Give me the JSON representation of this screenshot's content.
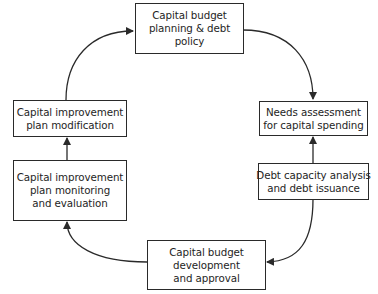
{
  "diagram": {
    "type": "cycle-flowchart",
    "nodes": [
      {
        "id": "planning",
        "lines": [
          "Capital budget",
          "planning & debt",
          "policy"
        ]
      },
      {
        "id": "needs",
        "lines": [
          "Needs assessment",
          "for capital spending"
        ]
      },
      {
        "id": "debt",
        "lines": [
          "Debt capacity analysis",
          "and debt issuance"
        ]
      },
      {
        "id": "development",
        "lines": [
          "Capital budget",
          "development",
          "and approval"
        ]
      },
      {
        "id": "monitoring",
        "lines": [
          "Capital improvement",
          "plan monitoring",
          "and evaluation"
        ]
      },
      {
        "id": "modification",
        "lines": [
          "Capital improvement",
          "plan modification"
        ]
      }
    ],
    "edges": [
      {
        "from": "planning",
        "to": "needs"
      },
      {
        "from": "debt",
        "to": "needs"
      },
      {
        "from": "debt",
        "to": "development"
      },
      {
        "from": "development",
        "to": "monitoring"
      },
      {
        "from": "monitoring",
        "to": "modification"
      },
      {
        "from": "modification",
        "to": "planning"
      }
    ],
    "arrow_right_direction": "up",
    "colors": {
      "stroke": "#2a2a2a",
      "text": "#1e1e1e",
      "background": "#ffffff"
    }
  }
}
